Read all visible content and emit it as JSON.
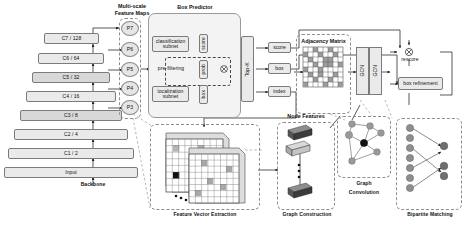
{
  "diagram": {
    "sections": {
      "backbone": {
        "caption": "Backbone",
        "layers": [
          {
            "name": "C7 / 128"
          },
          {
            "name": "C6 / 64"
          },
          {
            "name": "C5 / 32"
          },
          {
            "name": "C4 / 16"
          },
          {
            "name": "C3 / 8"
          },
          {
            "name": "C2 / 4"
          },
          {
            "name": "C1 / 2"
          },
          {
            "name": "Input"
          }
        ]
      },
      "multiscale": {
        "title_line1": "Multi-scale",
        "title_line2": "Feature Maps",
        "levels": [
          "P7",
          "P6",
          "P5",
          "P4",
          "P3"
        ]
      },
      "box_predictor": {
        "title": "Box Predictor",
        "classification_subnet_line1": "classification",
        "classification_subnet_line2": "subnet",
        "prefiltering": "pre-filtering",
        "localization_subnet_line1": "localization",
        "localization_subnet_line2": "subnet",
        "branch_labels": [
          "score",
          "prob",
          "box"
        ],
        "topk": "Top-K",
        "outputs": [
          "score",
          "box",
          "index"
        ]
      },
      "adjacency": {
        "title": "Adjacency Matrix",
        "gcn_labels": [
          "GCN",
          "GCN"
        ]
      },
      "heads": {
        "rescore": "rescore",
        "box_refinement": "box refinement"
      },
      "feature_vector_extraction": {
        "caption": "Feature Vector Extraction"
      },
      "graph_construction": {
        "caption": "Graph Construction",
        "node_features_title": "Node Features"
      },
      "graph_convolution": {
        "caption_line1": "Graph",
        "caption_line2": "Convolution"
      },
      "bipartite_matching": {
        "caption": "Bipartite Matching",
        "left_nodes": 7,
        "right_nodes": 3
      }
    },
    "colors": {
      "box_fill": "#eaeaea",
      "box_fill_dark": "#d8d8d8",
      "stroke": "#7b7b7b",
      "dashed": "#8d8d8d",
      "group_fill": "#f3f3f3"
    }
  }
}
